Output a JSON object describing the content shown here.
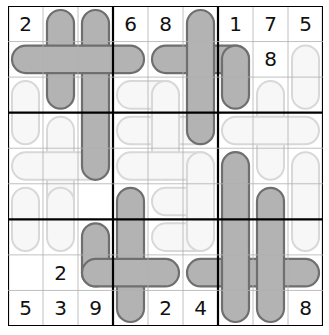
{
  "puzzle": {
    "rows": 9,
    "cols": 9,
    "colors": {
      "dark_fill": "#b3b3b3",
      "dark_stroke": "#6f6f6f",
      "light_fill": "#f7f7f7",
      "light_stroke": "#d8d8d8",
      "thin_line": "#b0b0b0",
      "thick_line": "#000000"
    },
    "givens": [
      {
        "r": 0,
        "c": 0,
        "v": "2"
      },
      {
        "r": 0,
        "c": 3,
        "v": "6"
      },
      {
        "r": 0,
        "c": 4,
        "v": "8"
      },
      {
        "r": 0,
        "c": 6,
        "v": "1"
      },
      {
        "r": 0,
        "c": 7,
        "v": "7"
      },
      {
        "r": 0,
        "c": 8,
        "v": "5"
      },
      {
        "r": 1,
        "c": 7,
        "v": "8"
      },
      {
        "r": 7,
        "c": 1,
        "v": "2"
      },
      {
        "r": 8,
        "c": 0,
        "v": "5"
      },
      {
        "r": 8,
        "c": 1,
        "v": "3"
      },
      {
        "r": 8,
        "c": 2,
        "v": "9"
      },
      {
        "r": 8,
        "c": 4,
        "v": "2"
      },
      {
        "r": 8,
        "c": 5,
        "v": "4"
      },
      {
        "r": 8,
        "c": 8,
        "v": "8"
      }
    ],
    "light_shapes": [
      {
        "r0": 2,
        "c0": 0,
        "r1": 3,
        "c1": 0
      },
      {
        "r0": 3,
        "c0": 1,
        "r1": 5,
        "c1": 1
      },
      {
        "r0": 4,
        "c0": 0,
        "r1": 4,
        "c1": 2
      },
      {
        "r0": 5,
        "c0": 0,
        "r1": 6,
        "c1": 0
      },
      {
        "r0": 2,
        "c0": 3,
        "r1": 2,
        "c1": 4
      },
      {
        "r0": 3,
        "c0": 3,
        "r1": 3,
        "c1": 5
      },
      {
        "r0": 2,
        "c0": 4,
        "r1": 4,
        "c1": 4
      },
      {
        "r0": 4,
        "c0": 3,
        "r1": 4,
        "c1": 5
      },
      {
        "r0": 5,
        "c0": 4,
        "r1": 5,
        "c1": 5
      },
      {
        "r0": 6,
        "c0": 4,
        "r1": 6,
        "c1": 5
      },
      {
        "r0": 1,
        "c0": 8,
        "r1": 2,
        "c1": 8
      },
      {
        "r0": 2,
        "c0": 7,
        "r1": 4,
        "c1": 7
      },
      {
        "r0": 3,
        "c0": 6,
        "r1": 3,
        "c1": 8
      },
      {
        "r0": 4,
        "c0": 8,
        "r1": 6,
        "c1": 8
      },
      {
        "r0": 5,
        "c0": 1,
        "r1": 6,
        "c1": 1
      },
      {
        "r0": 4,
        "c0": 5,
        "r1": 6,
        "c1": 5
      }
    ],
    "dark_shapes": [
      {
        "r0": 0,
        "c0": 1,
        "r1": 2,
        "c1": 1
      },
      {
        "r0": 0,
        "c0": 2,
        "r1": 4,
        "c1": 2
      },
      {
        "r0": 1,
        "c0": 0,
        "r1": 1,
        "c1": 3
      },
      {
        "r0": 1,
        "c0": 4,
        "r1": 1,
        "c1": 6
      },
      {
        "r0": 0,
        "c0": 5,
        "r1": 3,
        "c1": 5
      },
      {
        "r0": 1,
        "c0": 6,
        "r1": 2,
        "c1": 6
      },
      {
        "r0": 5,
        "c0": 3,
        "r1": 8,
        "c1": 3
      },
      {
        "r0": 6,
        "c0": 2,
        "r1": 7,
        "c1": 2
      },
      {
        "r0": 7,
        "c0": 2,
        "r1": 7,
        "c1": 4
      },
      {
        "r0": 7,
        "c0": 5,
        "r1": 7,
        "c1": 8
      },
      {
        "r0": 4,
        "c0": 6,
        "r1": 8,
        "c1": 6
      },
      {
        "r0": 5,
        "c0": 7,
        "r1": 8,
        "c1": 7
      }
    ]
  }
}
